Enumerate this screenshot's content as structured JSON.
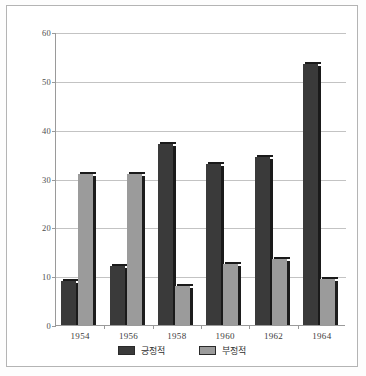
{
  "chart_data": {
    "type": "bar",
    "title": "",
    "subtitle": "",
    "xlabel": "",
    "ylabel": "",
    "categories": [
      "1954",
      "1956",
      "1958",
      "1960",
      "1962",
      "1964"
    ],
    "series": [
      {
        "name": "긍정적",
        "color": "#3a3a3a",
        "values": [
          9,
          12,
          37,
          33,
          34.5,
          53.5
        ]
      },
      {
        "name": "부정적",
        "color": "#9b9b9b",
        "values": [
          31,
          31,
          8,
          12.5,
          13.5,
          9.5
        ]
      }
    ],
    "ylim": [
      0,
      60
    ],
    "yticks": [
      0,
      10,
      20,
      30,
      40,
      50,
      60
    ],
    "ytick_labels": [
      "0",
      "10",
      "20",
      "30",
      "40",
      "50",
      "60"
    ],
    "grid": true,
    "grid_axis": "y",
    "legend_position": "bottom"
  },
  "legend": {
    "items": [
      {
        "label": "긍정적",
        "color": "#3a3a3a"
      },
      {
        "label": "부정적",
        "color": "#9b9b9b"
      }
    ]
  },
  "axes": {
    "y_labels": [
      "60",
      "50",
      "40",
      "30",
      "20",
      "10",
      "0"
    ],
    "x_labels": [
      "1954",
      "1956",
      "1958",
      "1960",
      "1962",
      "1964"
    ]
  },
  "colors": {
    "positive_bar": "#3a3a3a",
    "negative_bar": "#9b9b9b",
    "gridline": "#c3c3c3",
    "axis": "#9a9a9a",
    "frame_border": "#b4b4b4",
    "background": "#ffffff"
  }
}
